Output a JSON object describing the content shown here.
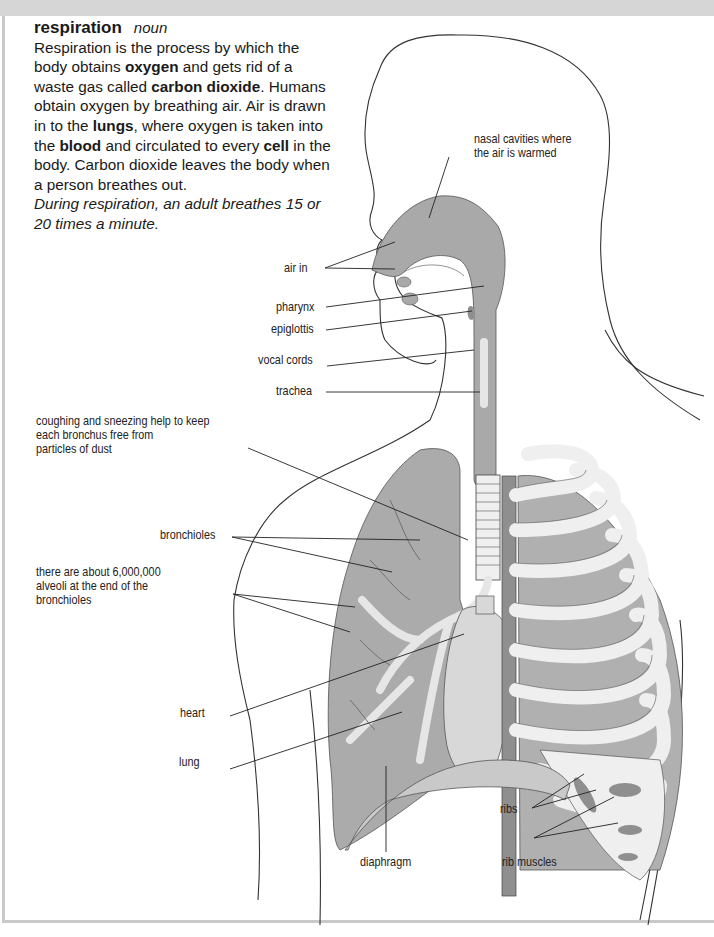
{
  "entry": {
    "headword": "respiration",
    "part_of_speech": "noun",
    "definition_parts": {
      "p1": "Respiration is the process by which the body obtains ",
      "b1": "oxygen",
      "p2": " and gets rid of a waste gas called ",
      "b2": "carbon dioxide",
      "p3": ". Humans obtain oxygen by breathing air. Air is drawn in to the ",
      "b3": "lungs",
      "p4": ", where oxygen is taken into the ",
      "b4": "blood",
      "p5": " and circulated to every ",
      "b5": "cell",
      "p6": " in the body. Carbon dioxide leaves the body when a person breathes out."
    },
    "example": "During respiration, an adult breathes 15 or 20 times a minute."
  },
  "illustration": {
    "title": "respiratory system diagram",
    "colors": {
      "tissue": "#a9a9a9",
      "tissue_dark": "#8f8f8f",
      "bone": "#efefef",
      "outline": "#333333"
    },
    "labels": {
      "nasal_line1": "nasal cavities where",
      "nasal_line2": "the air is warmed",
      "air_in": "air in",
      "pharynx": "pharynx",
      "epiglottis": "epiglottis",
      "vocal_cords": "vocal cords",
      "trachea": "trachea",
      "coughing_line1": "coughing and sneezing help to keep",
      "coughing_line2": "each bronchus free from",
      "coughing_line3": "particles of dust",
      "bronchioles": "bronchioles",
      "alveoli_line1": "there are about 6,000,000",
      "alveoli_line2": "alveoli at the end of the",
      "alveoli_line3": "bronchioles",
      "heart": "heart",
      "lung": "lung",
      "diaphragm": "diaphragm",
      "ribs": "ribs",
      "rib_muscles": "rib muscles"
    }
  }
}
